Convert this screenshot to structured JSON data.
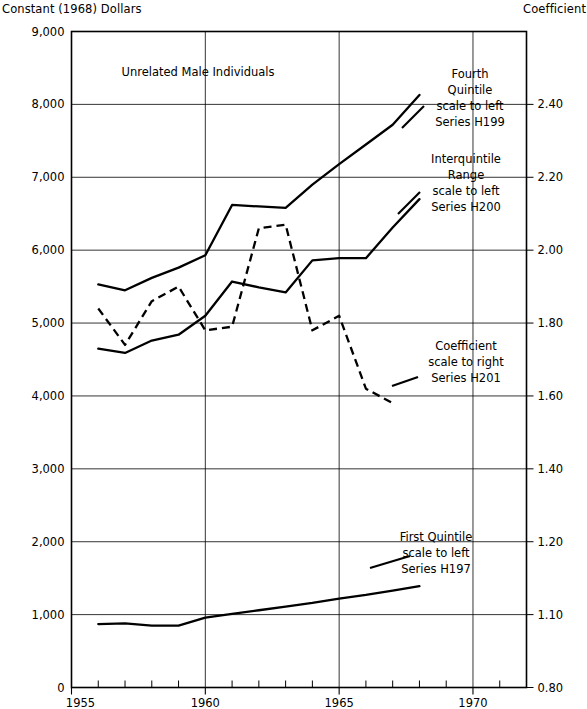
{
  "header": {
    "left_title": "Constant (1968) Dollars",
    "right_title": "Coefficient"
  },
  "plot_title": "Unrelated Male Individuals",
  "annotations": [
    {
      "name": "fourth-quintile",
      "lines": [
        "Fourth",
        "Quintile",
        "scale to left",
        "Series H199"
      ],
      "x": 470,
      "y": 78
    },
    {
      "name": "interquintile-range",
      "lines": [
        "Interquintile",
        "Range",
        "scale to left",
        "Series H200"
      ],
      "x": 466,
      "y": 163
    },
    {
      "name": "coefficient",
      "lines": [
        "Coefficient",
        "scale to right",
        "Series H201"
      ],
      "x": 466,
      "y": 350
    },
    {
      "name": "first-quintile",
      "lines": [
        "First Quintile",
        "scale to left",
        "Series H197"
      ],
      "x": 436,
      "y": 541
    }
  ],
  "chart_data": {
    "type": "line",
    "title": "Unrelated Male Individuals",
    "xlabel": "",
    "ylabel": "Constant (1968) Dollars",
    "y2label": "Coefficient",
    "xlim": [
      1955,
      1972
    ],
    "ylim": [
      0,
      9000
    ],
    "grid": true,
    "legend_position": "inline-annotations",
    "xticks_major": [
      1955,
      1960,
      1965,
      1970
    ],
    "xticks_minor": [
      1956,
      1957,
      1958,
      1959,
      1961,
      1962,
      1963,
      1964,
      1966,
      1967,
      1968,
      1969,
      1971,
      1972
    ],
    "yticks": [
      0,
      1000,
      2000,
      3000,
      4000,
      5000,
      6000,
      7000,
      8000,
      9000
    ],
    "ytick_labels": [
      "0",
      "1,000",
      "2,000",
      "3,000",
      "4,000",
      "5,000",
      "6,000",
      "7,000",
      "8,000",
      "9,000"
    ],
    "y2tick_labels": [
      "0.80",
      "1.10",
      "1.20",
      "1.40",
      "1.60",
      "1.80",
      "2.00",
      "2.20",
      "2.40"
    ],
    "y2tick_at_left_value": [
      0,
      1000,
      2000,
      3000,
      4000,
      5000,
      6000,
      7000,
      8000
    ],
    "series": [
      {
        "name": "Fourth Quintile",
        "code": "Series H199",
        "scale": "left",
        "style": "solid",
        "x": [
          1956,
          1957,
          1958,
          1959,
          1960,
          1961,
          1962,
          1963,
          1964,
          1965,
          1966,
          1967,
          1968
        ],
        "values": [
          5530,
          5450,
          5620,
          5760,
          5930,
          6620,
          6600,
          6580,
          6900,
          7180,
          7450,
          7720,
          8130
        ]
      },
      {
        "name": "Interquintile Range",
        "code": "Series H200",
        "scale": "left",
        "style": "solid",
        "x": [
          1956,
          1957,
          1958,
          1959,
          1960,
          1961,
          1962,
          1963,
          1964,
          1965,
          1966,
          1967,
          1968
        ],
        "values": [
          4650,
          4590,
          4760,
          4840,
          5100,
          5570,
          5490,
          5420,
          5860,
          5890,
          5890,
          6310,
          6700
        ]
      },
      {
        "name": "Coefficient",
        "code": "Series H201",
        "scale": "right",
        "style": "dashed",
        "x": [
          1956,
          1957,
          1958,
          1959,
          1960,
          1961,
          1962,
          1963,
          1964,
          1965,
          1966,
          1967
        ],
        "values": [
          1.84,
          1.74,
          1.86,
          1.9,
          1.78,
          1.79,
          2.06,
          2.07,
          1.78,
          1.82,
          1.62,
          1.58
        ]
      },
      {
        "name": "First Quintile",
        "code": "Series H197",
        "scale": "left",
        "style": "solid",
        "x": [
          1956,
          1957,
          1958,
          1959,
          1960,
          1961,
          1962,
          1963,
          1964,
          1965,
          1966,
          1967,
          1968
        ],
        "values": [
          870,
          880,
          850,
          850,
          960,
          1010,
          1060,
          1110,
          1160,
          1220,
          1270,
          1330,
          1390
        ]
      }
    ]
  }
}
